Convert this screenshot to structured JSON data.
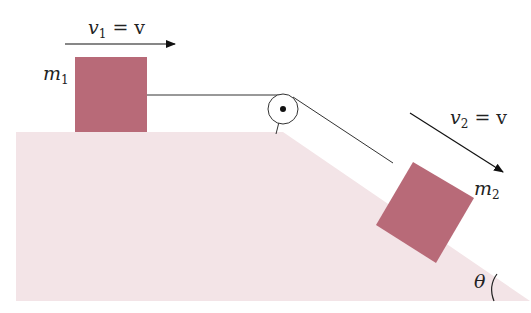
{
  "diagram": {
    "colors": {
      "ground": "#f3e4e7",
      "block": "#b86a78",
      "line": "#333333",
      "text": "#222222"
    },
    "labels": {
      "v1_main": "v",
      "v1_sub": "1",
      "v1_rhs": " = v",
      "v2_main": "v",
      "v2_sub": "2",
      "v2_rhs": " = v",
      "m1_main": "m",
      "m1_sub": "1",
      "m2_main": "m",
      "m2_sub": "2",
      "theta": "θ"
    },
    "elements": [
      {
        "id": "block-m1",
        "label": "m1",
        "surface": "horizontal",
        "velocity": "v1 = v",
        "direction": "right"
      },
      {
        "id": "block-m2",
        "label": "m2",
        "surface": "incline",
        "velocity": "v2 = v",
        "direction": "down-slope"
      },
      {
        "id": "pulley",
        "position": "top corner of incline"
      },
      {
        "id": "rope",
        "connects": [
          "block-m1",
          "pulley",
          "block-m2"
        ]
      },
      {
        "id": "incline-angle",
        "label": "θ"
      }
    ]
  }
}
